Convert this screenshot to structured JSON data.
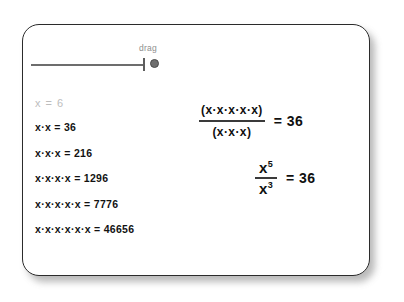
{
  "card": {
    "slider": {
      "label": "drag",
      "handle_name": "slider-handle"
    },
    "variable_readout": "x = 6",
    "expansions": [
      {
        "expression": "x·x = 36"
      },
      {
        "expression": "x·x·x = 216"
      },
      {
        "expression": "x·x·x·x = 1296"
      },
      {
        "expression": "x·x·x·x·x = 7776"
      },
      {
        "expression": "x·x·x·x·x·x = 46656"
      }
    ],
    "equation_expanded": {
      "numerator": "(x·x·x·x·x)",
      "denominator": "(x·x·x)",
      "result": "= 36"
    },
    "equation_powers": {
      "numerator_base": "x",
      "numerator_exponent": "5",
      "denominator_base": "x",
      "denominator_exponent": "3",
      "result": "= 36"
    }
  },
  "colors": {
    "card_border": "#2b2b2b",
    "text": "#121212",
    "muted_text": "#bdbdbd",
    "slider": "#6d6d6d",
    "background": "#ffffff"
  }
}
